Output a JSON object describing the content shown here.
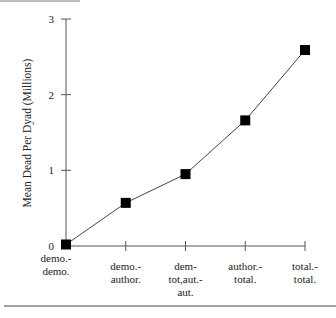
{
  "chart_data": {
    "type": "line",
    "title": "",
    "xlabel": "",
    "ylabel": "Mean Dead Per Dyad (Millions)",
    "ylim": [
      0,
      3
    ],
    "yticks": [
      "0",
      "1",
      "2",
      "3"
    ],
    "grid": false,
    "legend": null,
    "categories": [
      [
        "demo.-",
        "demo."
      ],
      [
        "demo.-",
        "author."
      ],
      [
        "dem-",
        "tot,aut.-",
        "aut."
      ],
      [
        "author.-",
        "total."
      ],
      [
        "total.-",
        "total."
      ]
    ],
    "categories_flat": [
      "demo.-demo.",
      "demo.-author.",
      "dem-tot,aut.-aut.",
      "author.-total.",
      "total.-total."
    ],
    "series": [
      {
        "name": "Mean Dead Per Dyad",
        "marker": "square",
        "values": [
          0.02,
          0.57,
          0.95,
          1.66,
          2.59
        ]
      }
    ]
  }
}
